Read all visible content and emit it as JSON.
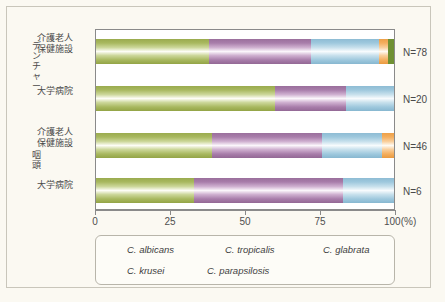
{
  "chart_data": {
    "type": "bar",
    "orientation": "horizontal",
    "stacked": true,
    "normalized": true,
    "title": "",
    "xlabel": "(%)",
    "ylabel": "",
    "xlim": [
      0,
      100
    ],
    "xticks": [
      0,
      25,
      50,
      75,
      100
    ],
    "xtick_labels": [
      "0",
      "25",
      "50",
      "75",
      "100(%)"
    ],
    "grid": false,
    "legend_position": "bottom",
    "categories": [
      "介護老人\n保健施設",
      "大学病院",
      "介護老人\n保健施設",
      "大学病院"
    ],
    "groups": [
      {
        "label": "デンチャー",
        "rows": [
          0,
          1
        ]
      },
      {
        "label": "咽頭",
        "rows": [
          2,
          3
        ]
      }
    ],
    "sample_sizes": [
      "N=78",
      "N=20",
      "N=46",
      "N=6"
    ],
    "series": [
      {
        "name": "C. albicans",
        "key": "albicans",
        "color": "#a8b85f",
        "values": [
          38,
          60,
          39,
          33
        ]
      },
      {
        "name": "C. tropicalis",
        "key": "tropicalis",
        "color": "#a87daa",
        "values": [
          34,
          24,
          37,
          50
        ]
      },
      {
        "name": "C. glabrata",
        "key": "glabrata",
        "color": "#9ec8dd",
        "values": [
          23,
          16,
          20,
          17
        ]
      },
      {
        "name": "C. krusei",
        "key": "krusei",
        "color": "#f4ae5e",
        "values": [
          3,
          0,
          4,
          0
        ]
      },
      {
        "name": "C. parapsilosis",
        "key": "parapsilosis",
        "color": "#6f9033",
        "values": [
          2,
          0,
          0,
          0
        ]
      }
    ]
  },
  "axis": {
    "tick_0": "0",
    "tick_25": "25",
    "tick_50": "50",
    "tick_75": "75",
    "tick_100": "100(%)"
  },
  "rows": {
    "label_0": "介護老人\n保健施設",
    "label_1": "大学病院",
    "label_2": "介護老人\n保健施設",
    "label_3": "大学病院",
    "n_0": "N=78",
    "n_1": "N=20",
    "n_2": "N=46",
    "n_3": "N=6"
  },
  "groups": {
    "label_0": "デンチャー",
    "label_1": "咽頭"
  },
  "legend": {
    "items": [
      {
        "label": "C. albicans"
      },
      {
        "label": "C. tropicalis"
      },
      {
        "label": "C. glabrata"
      },
      {
        "label": "C. krusei"
      },
      {
        "label": "C. parapsilosis"
      }
    ]
  }
}
